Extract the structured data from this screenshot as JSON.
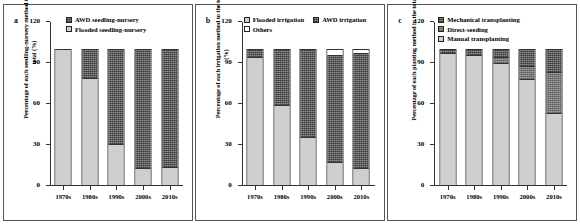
{
  "figure": {
    "panels": [
      {
        "letter": "a",
        "ylabel": "Percentage of each seedling-nursery method to the total (%)",
        "legend_layout": "stacked",
        "legend": [
          {
            "label": "AWD seedling-nursery",
            "fill": "dark"
          },
          {
            "label": "Flooded seedling-nursery",
            "fill": "light"
          }
        ],
        "chart_data": {
          "type": "bar",
          "stacked": true,
          "title": "",
          "xlabel": "",
          "ylabel": "Percentage of each seedling-nursery method to the total (%)",
          "categories": [
            "1970s",
            "1980s",
            "1990s",
            "2000s",
            "2010s"
          ],
          "yticks": [
            0,
            30,
            60,
            90,
            120
          ],
          "ylim": [
            0,
            120
          ],
          "grid": false,
          "legend_position": "top",
          "series": [
            {
              "name": "Flooded seedling-nursery",
              "fill": "light",
              "values": [
                100,
                79,
                30,
                12,
                13
              ]
            },
            {
              "name": "AWD seedling-nursery",
              "fill": "dark",
              "values": [
                0,
                21,
                70,
                88,
                87
              ]
            }
          ]
        }
      },
      {
        "letter": "b",
        "ylabel": "Percentage of each irrigation method to the total (%)",
        "legend_layout": "inline-then-stacked",
        "legend": [
          {
            "label": "Flooded irrigation",
            "fill": "light"
          },
          {
            "label": "AWD irrigation",
            "fill": "dark"
          },
          {
            "label": "Others",
            "fill": "white"
          }
        ],
        "chart_data": {
          "type": "bar",
          "stacked": true,
          "title": "",
          "xlabel": "",
          "ylabel": "Percentage of each irrigation method to the total (%)",
          "categories": [
            "1970s",
            "1980s",
            "1990s",
            "2000s",
            "2010s"
          ],
          "yticks": [
            0,
            30,
            60,
            90,
            120
          ],
          "ylim": [
            0,
            120
          ],
          "grid": false,
          "legend_position": "top",
          "series": [
            {
              "name": "Flooded irrigation",
              "fill": "light",
              "values": [
                94,
                59,
                35,
                16,
                12
              ]
            },
            {
              "name": "AWD irrigation",
              "fill": "dark",
              "values": [
                6,
                41,
                65,
                80,
                85
              ]
            },
            {
              "name": "Others",
              "fill": "white",
              "values": [
                0,
                0,
                0,
                4,
                3
              ]
            }
          ]
        }
      },
      {
        "letter": "c",
        "ylabel": "Percentage of each planting method in the total (%)",
        "legend_layout": "stacked",
        "legend": [
          {
            "label": "Mechanical transplanting",
            "fill": "dark"
          },
          {
            "label": "Direct-seeding",
            "fill": "mid"
          },
          {
            "label": "Manual transplanting",
            "fill": "light"
          }
        ],
        "chart_data": {
          "type": "bar",
          "stacked": true,
          "title": "",
          "xlabel": "",
          "ylabel": "Percentage of each planting method in the total (%)",
          "categories": [
            "1970s",
            "1980s",
            "1990s",
            "2000s",
            "2010s"
          ],
          "yticks": [
            0,
            30,
            60,
            90,
            120
          ],
          "ylim": [
            0,
            120
          ],
          "grid": false,
          "legend_position": "top",
          "series": [
            {
              "name": "Manual transplanting",
              "fill": "light",
              "values": [
                97,
                96,
                90,
                78,
                53
              ]
            },
            {
              "name": "Direct-seeding",
              "fill": "mid",
              "values": [
                0,
                0,
                4,
                10,
                30
              ]
            },
            {
              "name": "Mechanical transplanting",
              "fill": "dark",
              "values": [
                3,
                4,
                6,
                12,
                17
              ]
            }
          ]
        }
      }
    ]
  }
}
